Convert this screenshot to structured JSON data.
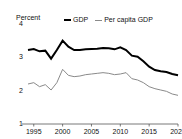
{
  "chart_data": {
    "type": "line",
    "title": "",
    "xlabel": "",
    "ylabel": "Percent",
    "ylim": [
      1,
      4
    ],
    "xlim": [
      1994,
      2020
    ],
    "grid": false,
    "legend_position": "top-center",
    "y_ticks": [
      "4",
      "3",
      "2",
      "1"
    ],
    "y_tick_values": [
      4,
      3,
      2,
      1
    ],
    "x_ticks": [
      "1995",
      "2000",
      "2005",
      "2010",
      "2015",
      "2020"
    ],
    "x_tick_values": [
      1995,
      2000,
      2005,
      2010,
      2015,
      2020
    ],
    "x": [
      1994,
      1995,
      1996,
      1997,
      1998,
      1999,
      2000,
      2001,
      2002,
      2003,
      2004,
      2005,
      2006,
      2007,
      2008,
      2009,
      2010,
      2011,
      2012,
      2013,
      2014,
      2015,
      2016,
      2017,
      2018,
      2019,
      2020
    ],
    "series": [
      {
        "name": "GDP",
        "color": "#000000",
        "width": 2,
        "values": [
          3.22,
          3.25,
          3.18,
          3.2,
          2.96,
          3.22,
          3.5,
          3.32,
          3.22,
          3.22,
          3.24,
          3.25,
          3.26,
          3.28,
          3.27,
          3.24,
          3.3,
          3.22,
          3.05,
          3.02,
          2.88,
          2.72,
          2.62,
          2.58,
          2.56,
          2.5,
          2.46
        ]
      },
      {
        "name": "Per capita GDP",
        "color": "#8a8a8a",
        "width": 1,
        "values": [
          2.2,
          2.24,
          2.12,
          2.18,
          2.02,
          2.24,
          2.64,
          2.46,
          2.42,
          2.44,
          2.48,
          2.5,
          2.52,
          2.54,
          2.52,
          2.48,
          2.5,
          2.54,
          2.36,
          2.32,
          2.24,
          2.12,
          2.06,
          2.02,
          1.98,
          1.9,
          1.86
        ]
      }
    ]
  },
  "axis": {
    "unit_label": "Percent"
  },
  "legend": {
    "items": [
      {
        "label": "GDP"
      },
      {
        "label": "Per capita GDP"
      }
    ]
  },
  "colors": {
    "gdp": "#000000",
    "per_capita_gdp": "#8a8a8a",
    "axis": "#555555",
    "background": "#ffffff"
  }
}
